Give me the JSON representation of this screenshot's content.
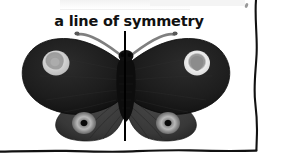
{
  "page": {
    "background_color": "#ffffff",
    "width": 282,
    "height": 157
  },
  "caption": {
    "text": "a line of symmetry",
    "color": "#111111",
    "weight": "bold"
  },
  "illustration": {
    "subject": "butterfly",
    "description": "A dark butterfly viewed from above with wings spread, bisected by a vertical line of symmetry",
    "colors": {
      "forewing": "#1a1a1a",
      "forewing_shadow": "#2b2b2b",
      "hindwing": "#3a3a3a",
      "hindwing_shadow": "#2e2e2e",
      "body": "#0d0d0d",
      "antenna": "#7a7a7a",
      "eyespot_ring_left": "#c8c8c8",
      "eyespot_center_left": "#9a9a9a",
      "eyespot_ring_right": "#e2e2e2",
      "eyespot_center_right": "#8e8e8e",
      "hindwing_eyespot_halo": "#b4b4b4",
      "hindwing_eyespot_pupil": "#0a0a0a",
      "symmetry_line": "#000000",
      "page_border": "#111111"
    },
    "parts": [
      "left-forewing",
      "right-forewing",
      "left-hindwing",
      "right-hindwing",
      "body",
      "left-antenna",
      "right-antenna",
      "left-forewing-eyespot",
      "right-forewing-eyespot",
      "left-hindwing-eyespot",
      "right-hindwing-eyespot"
    ]
  },
  "symmetry_line": {
    "orientation": "vertical",
    "color": "#000000"
  },
  "border": {
    "style": "hand-drawn",
    "edges": [
      "right",
      "bottom"
    ],
    "color": "#111111"
  }
}
